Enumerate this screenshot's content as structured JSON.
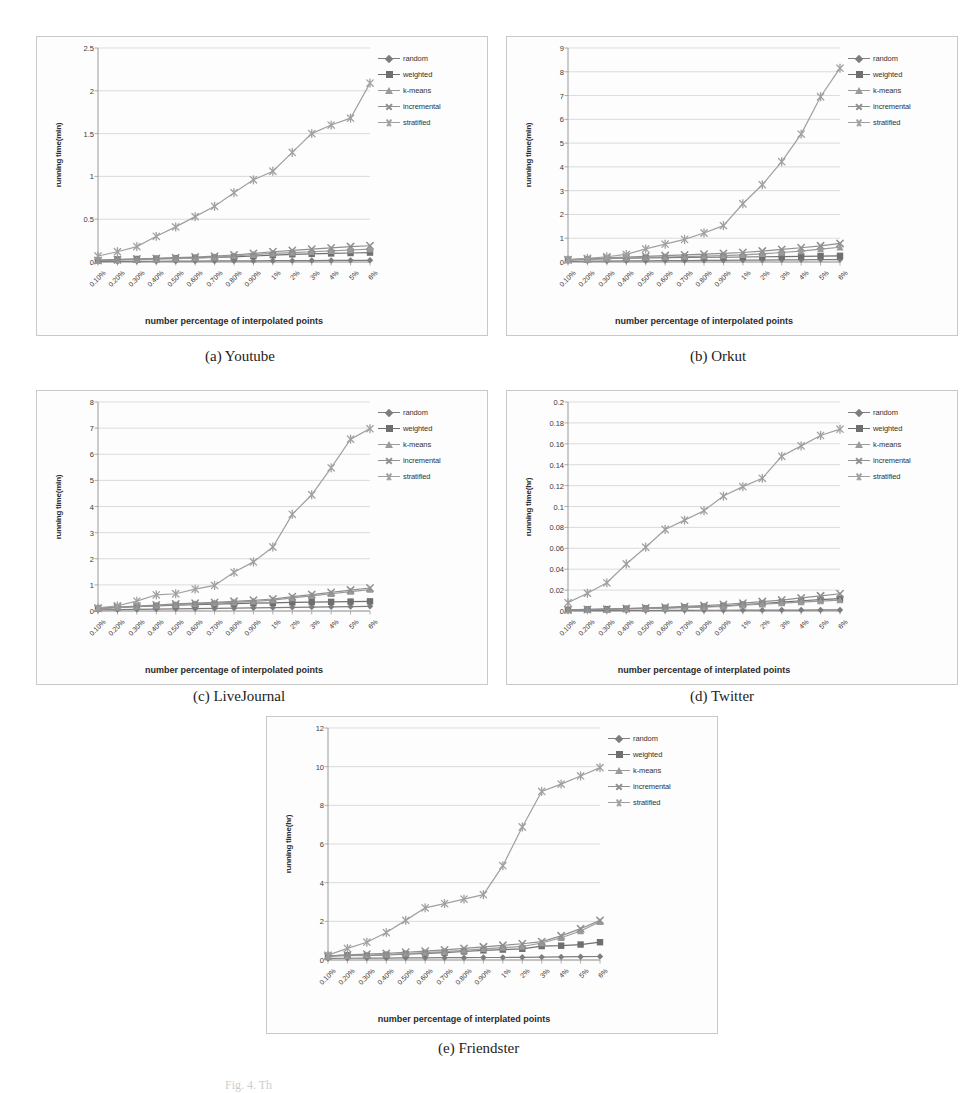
{
  "figure": {
    "caption_partial": "Fig. 4. Th",
    "series_names": [
      "random",
      "weighted",
      "k-means",
      "incremental",
      "stratified"
    ],
    "series_markers": [
      "diamond",
      "square",
      "triangle",
      "cross",
      "star"
    ],
    "series_colors": [
      "#7d7d7d",
      "#6f6f6f",
      "#9a9a9a",
      "#8f8f8f",
      "#a0a0a0"
    ],
    "categories": [
      "0.10%",
      "0.20%",
      "0.30%",
      "0.40%",
      "0.50%",
      "0.60%",
      "0.70%",
      "0.80%",
      "0.90%",
      "1%",
      "2%",
      "3%",
      "4%",
      "5%",
      "6%"
    ]
  },
  "panels": [
    {
      "key": "a",
      "caption": "(a)   Youtube"
    },
    {
      "key": "b",
      "caption": "(b) Orkut"
    },
    {
      "key": "c",
      "caption": "(c) LiveJournal"
    },
    {
      "key": "d",
      "caption": "(d) Twitter"
    },
    {
      "key": "e",
      "caption": "(e) Friendster"
    }
  ],
  "chart_data": [
    {
      "id": "youtube",
      "type": "line",
      "title": "(a)   Youtube",
      "xlabel": "number percentage of interpolated points",
      "ylabel": "running time(min)",
      "categories": [
        "0.10%",
        "0.20%",
        "0.30%",
        "0.40%",
        "0.50%",
        "0.60%",
        "0.70%",
        "0.80%",
        "0.90%",
        "1%",
        "2%",
        "3%",
        "4%",
        "5%",
        "6%"
      ],
      "yticks": [
        "0",
        "0.5",
        "1",
        "1.5",
        "2",
        "2.5"
      ],
      "ylim": [
        0,
        2.5
      ],
      "grid": true,
      "legend_position": "right",
      "series": [
        {
          "name": "random",
          "values": [
            0.005,
            0.006,
            0.008,
            0.009,
            0.01,
            0.011,
            0.012,
            0.013,
            0.014,
            0.015,
            0.016,
            0.017,
            0.018,
            0.019,
            0.02
          ]
        },
        {
          "name": "weighted",
          "values": [
            0.02,
            0.03,
            0.035,
            0.04,
            0.045,
            0.05,
            0.055,
            0.06,
            0.07,
            0.08,
            0.09,
            0.095,
            0.1,
            0.105,
            0.11
          ]
        },
        {
          "name": "k-means",
          "values": [
            0.015,
            0.022,
            0.028,
            0.034,
            0.04,
            0.046,
            0.055,
            0.07,
            0.085,
            0.1,
            0.11,
            0.12,
            0.13,
            0.14,
            0.15
          ]
        },
        {
          "name": "incremental",
          "values": [
            0.018,
            0.026,
            0.034,
            0.042,
            0.05,
            0.058,
            0.068,
            0.082,
            0.1,
            0.12,
            0.135,
            0.15,
            0.165,
            0.18,
            0.19
          ]
        },
        {
          "name": "stratified",
          "values": [
            0.07,
            0.12,
            0.18,
            0.3,
            0.41,
            0.53,
            0.65,
            0.81,
            0.96,
            1.06,
            1.28,
            1.5,
            1.6,
            1.68,
            2.09
          ]
        }
      ]
    },
    {
      "id": "orkut",
      "type": "line",
      "title": "(b) Orkut",
      "xlabel": "number percentage of interpolated points",
      "ylabel": "running time(min)",
      "categories": [
        "0.10%",
        "0.20%",
        "0.30%",
        "0.40%",
        "0.50%",
        "0.60%",
        "0.70%",
        "0.80%",
        "0.90%",
        "1%",
        "2%",
        "3%",
        "4%",
        "5%",
        "6%"
      ],
      "yticks": [
        "0",
        "1",
        "2",
        "3",
        "4",
        "5",
        "6",
        "7",
        "8",
        "9"
      ],
      "ylim": [
        0,
        9
      ],
      "grid": true,
      "legend_position": "right",
      "series": [
        {
          "name": "random",
          "values": [
            0.03,
            0.04,
            0.04,
            0.05,
            0.05,
            0.06,
            0.06,
            0.07,
            0.07,
            0.08,
            0.08,
            0.09,
            0.09,
            0.1,
            0.1
          ]
        },
        {
          "name": "weighted",
          "values": [
            0.1,
            0.12,
            0.14,
            0.16,
            0.17,
            0.18,
            0.19,
            0.2,
            0.2,
            0.21,
            0.22,
            0.23,
            0.24,
            0.25,
            0.26
          ]
        },
        {
          "name": "k-means",
          "values": [
            0.08,
            0.11,
            0.14,
            0.17,
            0.19,
            0.21,
            0.23,
            0.25,
            0.27,
            0.3,
            0.34,
            0.4,
            0.46,
            0.54,
            0.62
          ]
        },
        {
          "name": "incremental",
          "values": [
            0.09,
            0.13,
            0.17,
            0.21,
            0.24,
            0.27,
            0.3,
            0.33,
            0.36,
            0.4,
            0.46,
            0.53,
            0.6,
            0.68,
            0.78
          ]
        },
        {
          "name": "stratified",
          "values": [
            0.1,
            0.15,
            0.22,
            0.32,
            0.55,
            0.75,
            0.95,
            1.22,
            1.53,
            2.45,
            3.25,
            4.22,
            5.38,
            6.95,
            8.15
          ]
        }
      ]
    },
    {
      "id": "livejournal",
      "type": "line",
      "title": "(c) LiveJournal",
      "xlabel": "number percentage of interpolated points",
      "ylabel": "running time(min)",
      "categories": [
        "0.10%",
        "0.20%",
        "0.30%",
        "0.40%",
        "0.50%",
        "0.60%",
        "0.70%",
        "0.80%",
        "0.90%",
        "1%",
        "2%",
        "3%",
        "4%",
        "5%",
        "6%"
      ],
      "yticks": [
        "0",
        "1",
        "2",
        "3",
        "4",
        "5",
        "6",
        "7",
        "8"
      ],
      "ylim": [
        0,
        8
      ],
      "grid": true,
      "legend_position": "right",
      "series": [
        {
          "name": "random",
          "values": [
            0.04,
            0.05,
            0.06,
            0.07,
            0.08,
            0.09,
            0.1,
            0.11,
            0.12,
            0.13,
            0.14,
            0.15,
            0.16,
            0.17,
            0.18
          ]
        },
        {
          "name": "weighted",
          "values": [
            0.1,
            0.14,
            0.17,
            0.2,
            0.22,
            0.24,
            0.26,
            0.28,
            0.3,
            0.31,
            0.33,
            0.34,
            0.35,
            0.36,
            0.37
          ]
        },
        {
          "name": "k-means",
          "values": [
            0.09,
            0.13,
            0.17,
            0.21,
            0.24,
            0.27,
            0.3,
            0.33,
            0.37,
            0.42,
            0.5,
            0.58,
            0.66,
            0.74,
            0.82
          ]
        },
        {
          "name": "incremental",
          "values": [
            0.1,
            0.15,
            0.19,
            0.23,
            0.27,
            0.3,
            0.33,
            0.37,
            0.41,
            0.46,
            0.55,
            0.63,
            0.71,
            0.8,
            0.88
          ]
        },
        {
          "name": "stratified",
          "values": [
            0.12,
            0.2,
            0.38,
            0.62,
            0.66,
            0.84,
            0.98,
            1.48,
            1.88,
            2.45,
            3.7,
            4.45,
            5.48,
            6.58,
            6.98
          ]
        }
      ]
    },
    {
      "id": "twitter",
      "type": "line",
      "title": "(d) Twitter",
      "xlabel": "number percentage of interplated points",
      "ylabel": "running time(hr)",
      "categories": [
        "0.10%",
        "0.20%",
        "0.30%",
        "0.40%",
        "0.50%",
        "0.60%",
        "0.70%",
        "0.80%",
        "0.90%",
        "1%",
        "2%",
        "3%",
        "4%",
        "5%",
        "6%"
      ],
      "yticks": [
        "0",
        "0.02",
        "0.04",
        "0.06",
        "0.08",
        "0.1",
        "0.12",
        "0.14",
        "0.16",
        "0.18",
        "0.2"
      ],
      "ylim": [
        0,
        0.2
      ],
      "grid": true,
      "legend_position": "right",
      "series": [
        {
          "name": "random",
          "values": [
            0.0003,
            0.0004,
            0.0004,
            0.0005,
            0.0005,
            0.0006,
            0.0006,
            0.0007,
            0.0007,
            0.0008,
            0.0008,
            0.0009,
            0.0009,
            0.001,
            0.001
          ]
        },
        {
          "name": "weighted",
          "values": [
            0.0012,
            0.0016,
            0.0018,
            0.0022,
            0.0026,
            0.003,
            0.0036,
            0.0042,
            0.005,
            0.0062,
            0.0072,
            0.0085,
            0.0098,
            0.0108,
            0.0118
          ]
        },
        {
          "name": "k-means",
          "values": [
            0.0008,
            0.0012,
            0.0015,
            0.0019,
            0.0023,
            0.0027,
            0.0032,
            0.0038,
            0.0045,
            0.0055,
            0.0065,
            0.0075,
            0.0085,
            0.0095,
            0.0105
          ]
        },
        {
          "name": "incremental",
          "values": [
            0.001,
            0.0014,
            0.0018,
            0.0024,
            0.003,
            0.0036,
            0.0044,
            0.0052,
            0.0062,
            0.0075,
            0.009,
            0.0105,
            0.0125,
            0.0145,
            0.0165
          ]
        },
        {
          "name": "stratified",
          "values": [
            0.008,
            0.017,
            0.027,
            0.045,
            0.061,
            0.078,
            0.087,
            0.096,
            0.11,
            0.119,
            0.127,
            0.148,
            0.158,
            0.168,
            0.174
          ]
        }
      ]
    },
    {
      "id": "friendster",
      "type": "line",
      "title": "(e) Friendster",
      "xlabel": "number percentage of interplated points",
      "ylabel": "running time(hr)",
      "categories": [
        "0.10%",
        "0.20%",
        "0.30%",
        "0.40%",
        "0.50%",
        "0.60%",
        "0.70%",
        "0.80%",
        "0.90%",
        "1%",
        "2%",
        "3%",
        "4%",
        "5%",
        "6%"
      ],
      "yticks": [
        "0",
        "2",
        "4",
        "6",
        "8",
        "10",
        "12"
      ],
      "ylim": [
        0,
        12
      ],
      "grid": true,
      "legend_position": "right",
      "series": [
        {
          "name": "random",
          "values": [
            0.08,
            0.09,
            0.1,
            0.1,
            0.11,
            0.11,
            0.12,
            0.12,
            0.13,
            0.13,
            0.14,
            0.15,
            0.16,
            0.17,
            0.18
          ]
        },
        {
          "name": "weighted",
          "values": [
            0.22,
            0.25,
            0.22,
            0.26,
            0.3,
            0.34,
            0.38,
            0.44,
            0.5,
            0.54,
            0.58,
            0.72,
            0.74,
            0.8,
            0.92
          ]
        },
        {
          "name": "k-means",
          "values": [
            0.18,
            0.22,
            0.24,
            0.28,
            0.33,
            0.38,
            0.43,
            0.5,
            0.58,
            0.64,
            0.7,
            0.88,
            1.15,
            1.5,
            1.98
          ]
        },
        {
          "name": "incremental",
          "values": [
            0.2,
            0.26,
            0.3,
            0.34,
            0.4,
            0.46,
            0.52,
            0.6,
            0.68,
            0.76,
            0.84,
            0.95,
            1.25,
            1.62,
            2.05
          ]
        },
        {
          "name": "stratified",
          "values": [
            0.25,
            0.6,
            0.92,
            1.42,
            2.05,
            2.7,
            2.92,
            3.15,
            3.38,
            4.88,
            6.88,
            8.72,
            9.1,
            9.52,
            9.95
          ]
        }
      ]
    }
  ]
}
